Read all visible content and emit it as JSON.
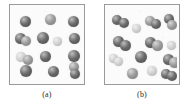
{
  "figure": {
    "background_color": "#ffffff",
    "panel_border_color": "#9a9a9a",
    "panel_fill_color": "#fbfbfb",
    "cell_dark_color": "#6b6b6b",
    "cell_mid_color": "#9c9c9c",
    "cell_light_color": "#d2d2d2",
    "panels": [
      {
        "id": "panel-a",
        "caption": "(a)",
        "left": 9,
        "top": 4,
        "width": 76,
        "height": 81,
        "cells": [
          {
            "x": 8,
            "y": 9,
            "d": 11,
            "tone": "dark",
            "rot": 0
          },
          {
            "x": 33,
            "y": 7,
            "d": 11,
            "tone": "mid",
            "rot": 0
          },
          {
            "x": 56,
            "y": 9,
            "d": 11,
            "tone": "dark",
            "rot": 0
          },
          {
            "x": 3,
            "y": 26,
            "d": 11,
            "tone": "dark",
            "rot": 0
          },
          {
            "x": 9,
            "y": 29,
            "d": 10,
            "tone": "mid",
            "rot": 0
          },
          {
            "x": 25,
            "y": 25,
            "d": 12,
            "tone": "dark",
            "rot": 0
          },
          {
            "x": 41,
            "y": 30,
            "d": 9,
            "tone": "light",
            "rot": 0
          },
          {
            "x": 57,
            "y": 26,
            "d": 11,
            "tone": "dark",
            "rot": 0
          },
          {
            "x": 4,
            "y": 45,
            "d": 10,
            "tone": "light",
            "rot": 0
          },
          {
            "x": 11,
            "y": 48,
            "d": 10,
            "tone": "mid",
            "rot": 0
          },
          {
            "x": 28,
            "y": 44,
            "d": 11,
            "tone": "dark",
            "rot": 0
          },
          {
            "x": 56,
            "y": 43,
            "d": 12,
            "tone": "dark",
            "rot": 0
          },
          {
            "x": 8,
            "y": 58,
            "d": 12,
            "tone": "dark",
            "rot": 0
          },
          {
            "x": 36,
            "y": 59,
            "d": 11,
            "tone": "dark",
            "rot": 0
          },
          {
            "x": 57,
            "y": 55,
            "d": 10,
            "tone": "mid",
            "rot": 0
          },
          {
            "x": 58,
            "y": 62,
            "d": 10,
            "tone": "dark",
            "rot": 0
          }
        ]
      },
      {
        "id": "panel-b",
        "caption": "(b)",
        "left": 104,
        "top": 4,
        "width": 76,
        "height": 81,
        "cells": [
          {
            "x": 5,
            "y": 8,
            "d": 10,
            "tone": "dark",
            "rot": 0
          },
          {
            "x": 12,
            "y": 11,
            "d": 10,
            "tone": "dark",
            "rot": 0
          },
          {
            "x": 25,
            "y": 17,
            "d": 9,
            "tone": "light",
            "rot": 0
          },
          {
            "x": 38,
            "y": 9,
            "d": 10,
            "tone": "mid",
            "rot": 0
          },
          {
            "x": 44,
            "y": 12,
            "d": 10,
            "tone": "dark",
            "rot": 0
          },
          {
            "x": 57,
            "y": 7,
            "d": 10,
            "tone": "dark",
            "rot": 0
          },
          {
            "x": 60,
            "y": 13,
            "d": 10,
            "tone": "mid",
            "rot": 0
          },
          {
            "x": 6,
            "y": 29,
            "d": 11,
            "tone": "dark",
            "rot": 0
          },
          {
            "x": 13,
            "y": 33,
            "d": 11,
            "tone": "dark",
            "rot": 0
          },
          {
            "x": 38,
            "y": 30,
            "d": 11,
            "tone": "dark",
            "rot": 0
          },
          {
            "x": 45,
            "y": 33,
            "d": 11,
            "tone": "mid",
            "rot": 0
          },
          {
            "x": 60,
            "y": 34,
            "d": 9,
            "tone": "light",
            "rot": 0
          },
          {
            "x": 2,
            "y": 47,
            "d": 9,
            "tone": "light",
            "rot": 0
          },
          {
            "x": 7,
            "y": 50,
            "d": 9,
            "tone": "light",
            "rot": 0
          },
          {
            "x": 28,
            "y": 44,
            "d": 12,
            "tone": "dark",
            "rot": 0
          },
          {
            "x": 56,
            "y": 47,
            "d": 11,
            "tone": "dark",
            "rot": 0
          },
          {
            "x": 62,
            "y": 50,
            "d": 11,
            "tone": "mid",
            "rot": 0
          },
          {
            "x": 20,
            "y": 61,
            "d": 11,
            "tone": "mid",
            "rot": 0
          },
          {
            "x": 40,
            "y": 59,
            "d": 10,
            "tone": "light",
            "rot": 0
          },
          {
            "x": 54,
            "y": 62,
            "d": 10,
            "tone": "dark",
            "rot": 0
          },
          {
            "x": 60,
            "y": 64,
            "d": 10,
            "tone": "dark",
            "rot": 0
          }
        ]
      }
    ]
  }
}
